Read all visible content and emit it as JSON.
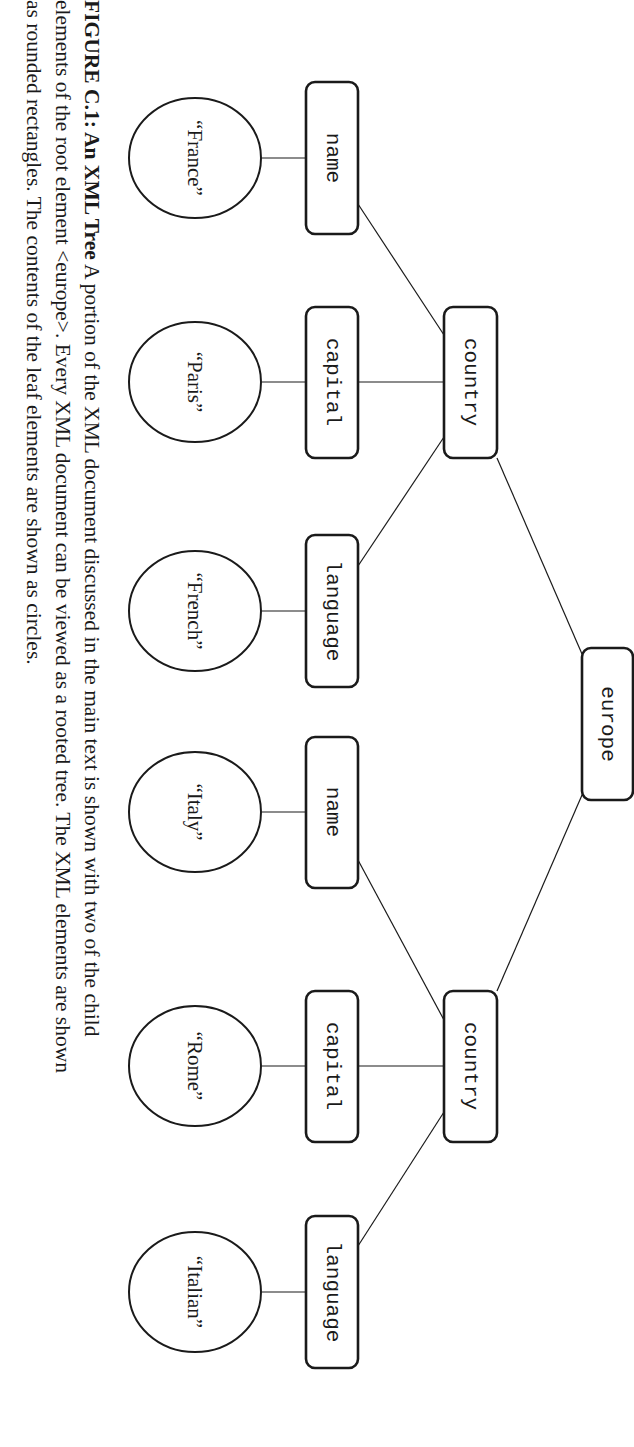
{
  "figure": {
    "orientation": "rotated 90deg clockwise",
    "nodes": {
      "root": {
        "label": "europe",
        "kind": "element"
      },
      "countries": [
        {
          "label": "country",
          "children": [
            {
              "label": "name",
              "value": "“France”"
            },
            {
              "label": "capital",
              "value": "“Paris”"
            },
            {
              "label": "language",
              "value": "“French”"
            }
          ]
        },
        {
          "label": "country",
          "children": [
            {
              "label": "name",
              "value": "“Italy”"
            },
            {
              "label": "capital",
              "value": "“Rome”"
            },
            {
              "label": "language",
              "value": "“Italian”"
            }
          ]
        }
      ]
    }
  },
  "caption": {
    "lead": "FIGURE C.1: An XML Tree",
    "line1_rest": " A portion of the XML document discussed in the main text is shown with two of the child",
    "line2": "elements of the root element <europe>. Every XML document can be viewed as a rooted tree. The XML elements are shown",
    "line3": "as rounded rectangles. The contents of the leaf elements are shown as circles."
  }
}
